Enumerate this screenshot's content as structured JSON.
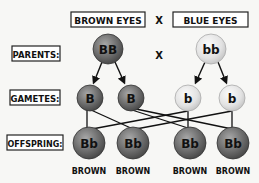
{
  "header": {
    "left_trait": "BROWN EYES",
    "cross_symbol": "X",
    "right_trait": "BLUE EYES"
  },
  "rows": {
    "parents_label": "PARENTS:",
    "gametes_label": "GAMETES:",
    "offspring_label": "OFFSPRING:"
  },
  "parents": [
    {
      "genotype": "BB",
      "color": "dark"
    },
    {
      "genotype": "bb",
      "color": "light"
    }
  ],
  "parents_cross": "X",
  "gametes": [
    {
      "allele": "B",
      "color": "dark"
    },
    {
      "allele": "B",
      "color": "dark"
    },
    {
      "allele": "b",
      "color": "light"
    },
    {
      "allele": "b",
      "color": "light"
    }
  ],
  "offspring": [
    {
      "genotype": "Bb",
      "phenotype": "BROWN"
    },
    {
      "genotype": "Bb",
      "phenotype": "BROWN"
    },
    {
      "genotype": "Bb",
      "phenotype": "BROWN"
    },
    {
      "genotype": "Bb",
      "phenotype": "BROWN"
    }
  ],
  "colors": {
    "dark_sphere": "#7a7a7a",
    "light_sphere": "#e6e6e6",
    "background": "#f7f7f5",
    "ink": "#111111"
  }
}
